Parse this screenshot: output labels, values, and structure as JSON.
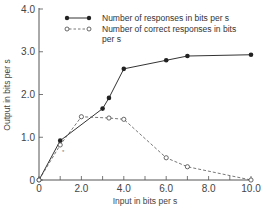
{
  "chart_data": {
    "type": "line",
    "title": "",
    "xlabel": "Input in bits per s",
    "ylabel": "Output in bits per s",
    "xlim": [
      0,
      10
    ],
    "ylim": [
      0,
      4
    ],
    "x_ticks": [
      "0",
      "2.0",
      "4.0",
      "6.0",
      "8.0",
      "10.0"
    ],
    "y_ticks": [
      "0",
      "1.0",
      "2.0",
      "3.0",
      "4.0"
    ],
    "grid": false,
    "legend_position": "upper right",
    "series": [
      {
        "name": "Number of responses in bits per s",
        "style": "solid line, filled circles",
        "x": [
          0,
          1.0,
          3.0,
          3.3,
          4.0,
          6.0,
          7.0,
          10.0
        ],
        "y": [
          0,
          0.92,
          1.67,
          1.92,
          2.6,
          2.8,
          2.9,
          2.93
        ]
      },
      {
        "name": "Number of correct responses in bits per s",
        "style": "dashed line, open circles",
        "x": [
          0,
          1.0,
          2.0,
          3.3,
          4.0,
          6.0,
          7.0,
          10.0
        ],
        "y": [
          0,
          0.82,
          1.48,
          1.45,
          1.42,
          0.52,
          0.31,
          0.0
        ]
      }
    ]
  },
  "legend": {
    "series1_line1": "Number of responses in bits per s",
    "series2_line1": "Number of correct responses in bits",
    "series2_line2": "per s"
  },
  "axes": {
    "xlabel": "Input in bits per s",
    "ylabel": "Output in bits per s"
  }
}
